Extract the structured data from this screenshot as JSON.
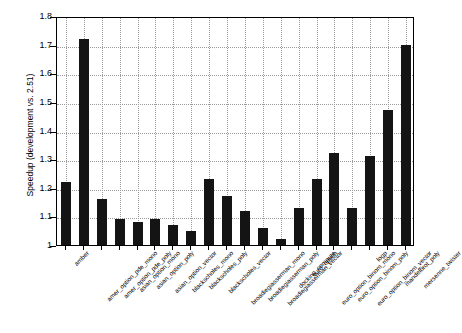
{
  "chart_data": {
    "type": "bar",
    "title": "",
    "xlabel": "",
    "ylabel": "Speedup (development vs. 2.51)",
    "ylim": [
      1,
      1.8
    ],
    "ytick_labels": [
      "1",
      "1.1",
      "1.2",
      "1.3",
      "1.4",
      "1.5",
      "1.6",
      "1.7",
      "1.8"
    ],
    "ytick_values": [
      1,
      1.1,
      1.2,
      1.3,
      1.4,
      1.5,
      1.6,
      1.7,
      1.8
    ],
    "grid": true,
    "grid_style": "dotted",
    "legend": "none",
    "bar_color": "#141414",
    "categories": [
      "amber",
      "amer_option_pde_mono",
      "amer_option_pde_poly",
      "asian_option_mono",
      "asian_option_poly",
      "asian_option_vector",
      "blackscholes_mono",
      "blackscholes_poly",
      "blackscholes_vector",
      "broadiegiasserman_mono",
      "broadiegiasserman_poly",
      "broadiegiasserman_vector",
      "docking_compute",
      "euro_option",
      "euro_option_binom_mono",
      "euro_option_binom_poly",
      "euro_option_binom_vector",
      "logp",
      "mandelbrot_poly",
      "mersenne_twister"
    ],
    "values": [
      1.22,
      1.72,
      1.16,
      1.09,
      1.08,
      1.09,
      1.07,
      1.05,
      1.23,
      1.17,
      1.12,
      1.06,
      1.02,
      1.13,
      1.23,
      1.32,
      1.13,
      1.31,
      1.47,
      1.7
    ]
  }
}
